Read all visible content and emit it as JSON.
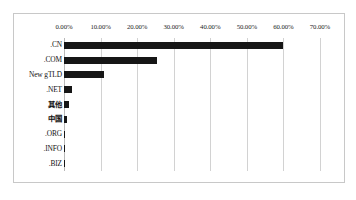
{
  "chart_data": {
    "type": "bar",
    "orientation": "horizontal",
    "title": "",
    "subtitle": "",
    "xlabel": "",
    "ylabel": "",
    "categories": [
      ".CN",
      ".COM",
      "New gTLD",
      ".NET",
      "其他",
      "中国",
      ".ORG",
      ".INFO",
      ".BIZ"
    ],
    "values": [
      59.81,
      25.48,
      11.02,
      2.21,
      1.29,
      0.75,
      0.23,
      0.12,
      0.09
    ],
    "value_format": "percent",
    "series": [
      {
        "name": "占比",
        "values": [
          59.81,
          25.48,
          11.02,
          2.21,
          1.29,
          0.75,
          0.23,
          0.12,
          0.09
        ]
      }
    ],
    "xlim": [
      0,
      70
    ],
    "xticks": [
      0,
      10,
      20,
      30,
      40,
      50,
      60,
      70
    ],
    "xtick_labels": [
      "0.00%",
      "10.00%",
      "20.00%",
      "30.00%",
      "40.00%",
      "50.00%",
      "60.00%",
      "70.00%"
    ],
    "grid": true,
    "grid_axis": "x",
    "legend": false,
    "legend_position": "none",
    "bar_color": "#161616",
    "grid_color": "#d2d2d2",
    "border_color": "#c8c8c8",
    "background_color": "#ffffff",
    "axis_position": "top"
  }
}
